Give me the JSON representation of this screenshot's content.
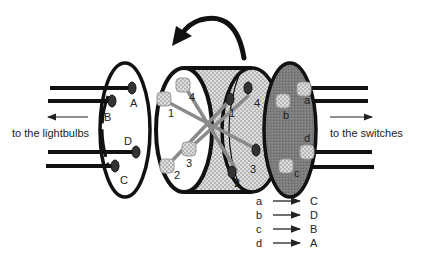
{
  "diagram": {
    "left_caption": "to the lightbulbs",
    "right_caption": "to the switches",
    "left_disk_labels": [
      "A",
      "B",
      "D",
      "C"
    ],
    "drum_left_labels": [
      "4",
      "1",
      "3",
      "2"
    ],
    "drum_right_labels": [
      "4",
      "1",
      "3",
      "2"
    ],
    "right_disk_labels": [
      "a",
      "b",
      "d",
      "c"
    ],
    "rotation_arrow": "counter-clockwise rotation arrow",
    "mapping": [
      {
        "from": "a",
        "to": "C"
      },
      {
        "from": "b",
        "to": "D"
      },
      {
        "from": "c",
        "to": "B"
      },
      {
        "from": "d",
        "to": "A"
      }
    ]
  },
  "colors": {
    "outline": "#111111",
    "drum_fill": "#d4d4d4",
    "right_disk_fill": "#7a7a7a",
    "wire": "#8a8a8a",
    "connector": "#e6e6e6"
  }
}
